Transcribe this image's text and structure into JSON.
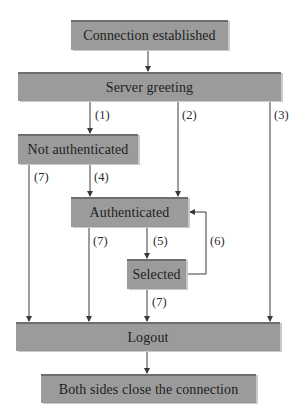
{
  "diagram": {
    "type": "state-flow",
    "boxes": {
      "connection_established": "Connection established",
      "server_greeting": "Server greeting",
      "not_authenticated": "Not authenticated",
      "authenticated": "Authenticated",
      "selected": "Selected",
      "logout": "Logout",
      "close": "Both sides close the connection"
    },
    "labels": {
      "t1": "(1)",
      "t2": "(2)",
      "t3": "(3)",
      "t4": "(4)",
      "t5": "(5)",
      "t6": "(6)",
      "t7a": "(7)",
      "t7b": "(7)",
      "t7c": "(7)"
    },
    "colors": {
      "box_fill": "#9b9b9b",
      "box_top_border": "#6e6e6e",
      "line": "#3a3a3a",
      "text": "#1e1e1e"
    }
  }
}
